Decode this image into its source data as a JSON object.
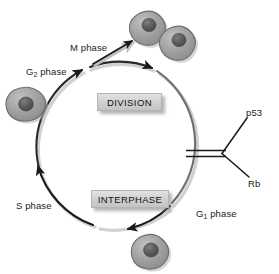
{
  "figure": {
    "background_color": "#ffffff"
  },
  "cycle": {
    "boxes": [
      {
        "id": "division",
        "label": "DIVISION"
      },
      {
        "id": "interphase",
        "label": "INTERPHASE"
      }
    ],
    "phase_labels": [
      {
        "id": "m-phase",
        "text": "M phase",
        "base": "M",
        "sub": "",
        "tail": " phase"
      },
      {
        "id": "g2-phase",
        "text": "G2 phase",
        "base": "G",
        "sub": "2",
        "tail": " phase"
      },
      {
        "id": "s-phase",
        "text": "S phase",
        "base": "S",
        "sub": "",
        "tail": " phase"
      },
      {
        "id": "g1-phase",
        "text": "G1 phase",
        "base": "G",
        "sub": "1",
        "tail": " phase"
      }
    ]
  },
  "regulators": {
    "items": [
      {
        "id": "p53",
        "label": "p53"
      },
      {
        "id": "rb",
        "label": "Rb"
      }
    ],
    "relation": "inhibition"
  },
  "cells": [
    {
      "id": "daughter-cell-1",
      "role": "daughter cell"
    },
    {
      "id": "daughter-cell-2",
      "role": "daughter cell"
    },
    {
      "id": "g2-cell",
      "role": "G2 phase cell"
    },
    {
      "id": "g1-cell",
      "role": "G1 phase cell"
    }
  ],
  "colors": {
    "cell_fill": "#9d9d9d",
    "cell_stroke": "#6f6f6f",
    "nucleus_fill": "#5a5a5a",
    "arrow": "#1a1a1a",
    "arrow_shadow": "#bdbdbd",
    "box_fill": "#d2d2d2",
    "text": "#1a1a1a"
  }
}
